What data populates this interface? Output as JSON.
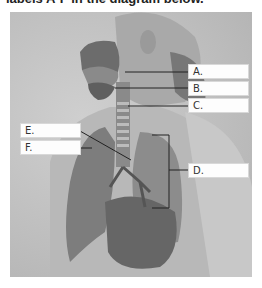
{
  "title": "labels A-F in the diagram below.",
  "diagram": {
    "labels": [
      {
        "id": "A",
        "text": "A."
      },
      {
        "id": "B",
        "text": "B."
      },
      {
        "id": "C",
        "text": "C."
      },
      {
        "id": "D",
        "text": "D."
      },
      {
        "id": "E",
        "text": "E."
      },
      {
        "id": "F",
        "text": "F."
      }
    ]
  },
  "colors": {
    "background": "#ffffff",
    "figure_bg": "#c2c2c2",
    "label_box": "#fdfdfd",
    "leader_line": "#222222"
  }
}
